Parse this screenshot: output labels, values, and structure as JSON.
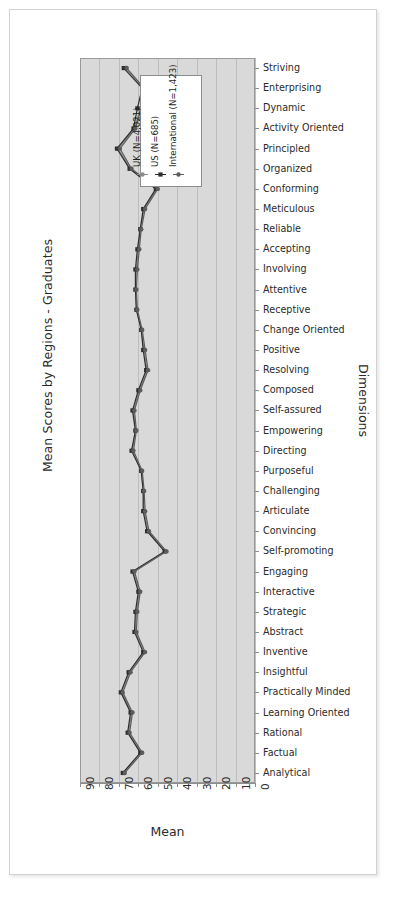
{
  "chart_data": {
    "type": "line",
    "title": "Mean Scores by Regions - Graduates",
    "xlabel": "Mean",
    "ylabel": "Dimensions",
    "orientation": "horizontal",
    "x_reversed": true,
    "xlim": [
      0,
      90
    ],
    "xticks": [
      "90",
      "80",
      "70",
      "60",
      "50",
      "40",
      "30",
      "20",
      "10",
      "0"
    ],
    "grid": "vertical",
    "legend_position": "top-center-inside",
    "panel_color": "#d9d9d9",
    "categories": [
      "Striving",
      "Enterprising",
      "Dynamic",
      "Activity Oriented",
      "Principled",
      "Organized",
      "Conforming",
      "Meticulous",
      "Reliable",
      "Accepting",
      "Involving",
      "Attentive",
      "Receptive",
      "Change Oriented",
      "Positive",
      "Resolving",
      "Composed",
      "Self-assured",
      "Empowering",
      "Directing",
      "Purposeful",
      "Challenging",
      "Articulate",
      "Convincing",
      "Self-promoting",
      "Engaging",
      "Interactive",
      "Strategic",
      "Abstract",
      "Inventive",
      "Insightful",
      "Practically Minded",
      "Learning Oriented",
      "Rational",
      "Factual",
      "Analytical"
    ],
    "series": [
      {
        "name": "UK (N=4,021)",
        "color": "#8a8a8a",
        "marker": "circle",
        "values": [
          66.5,
          57.5,
          59.0,
          62.0,
          70.5,
          64.0,
          50.5,
          57.0,
          59.0,
          60.0,
          61.0,
          61.5,
          61.0,
          58.5,
          57.0,
          55.5,
          59.5,
          62.5,
          61.5,
          63.0,
          58.5,
          57.5,
          57.0,
          55.0,
          46.0,
          62.5,
          59.5,
          61.0,
          61.5,
          57.0,
          64.5,
          68.5,
          63.5,
          65.0,
          58.5,
          67.5
        ]
      },
      {
        "name": "US (N=685)",
        "color": "#2e2e2e",
        "marker": "square",
        "values": [
          67.5,
          58.0,
          60.5,
          62.5,
          71.0,
          64.5,
          51.0,
          57.5,
          59.0,
          60.5,
          61.5,
          61.5,
          61.0,
          58.5,
          57.5,
          56.0,
          60.0,
          63.0,
          61.5,
          63.5,
          58.5,
          57.5,
          57.5,
          55.5,
          46.5,
          63.0,
          60.0,
          61.5,
          62.0,
          57.5,
          65.0,
          69.0,
          64.0,
          65.5,
          59.0,
          68.0
        ]
      },
      {
        "name": "International (N=1,423)",
        "color": "#5c5c5c",
        "marker": "circle",
        "values": [
          66.0,
          57.0,
          58.5,
          61.5,
          69.5,
          63.5,
          50.0,
          56.5,
          58.5,
          59.5,
          60.5,
          61.0,
          60.5,
          58.0,
          56.5,
          55.0,
          59.0,
          62.0,
          61.0,
          62.5,
          58.0,
          57.0,
          56.5,
          54.5,
          45.5,
          62.0,
          59.0,
          60.5,
          61.0,
          56.5,
          64.0,
          68.0,
          63.0,
          64.5,
          58.0,
          67.0
        ]
      }
    ]
  }
}
